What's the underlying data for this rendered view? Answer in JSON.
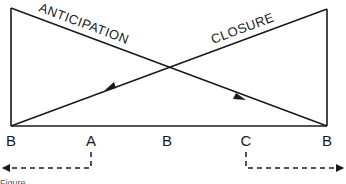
{
  "diagram": {
    "diagonal_labels": {
      "anticipation": "ANTICIPATION",
      "closure": "CLOSURE"
    },
    "bottom_labels": [
      "B",
      "A",
      "B",
      "C",
      "B"
    ],
    "caption": "Figure",
    "colors": {
      "line": "#1a1a1a",
      "background": "#ffffff"
    }
  }
}
